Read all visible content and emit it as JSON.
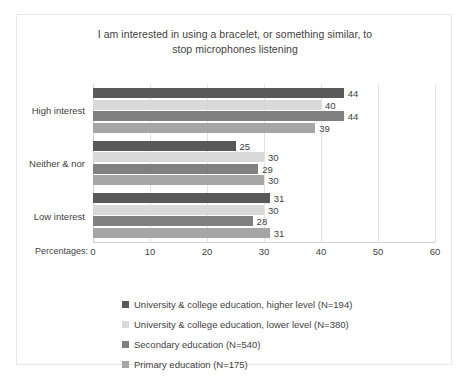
{
  "chart_data": {
    "type": "bar",
    "orientation": "horizontal",
    "title": "I am interested in using a bracelet, or something  similar, to\nstop microphones listening",
    "xlabel": "Percentages:",
    "ylabel": "",
    "categories": [
      "High interest",
      "Neither & nor",
      "Low interest"
    ],
    "series": [
      {
        "name": "University & college education, higher level  (N=194)",
        "color": "#595959",
        "values": [
          44,
          25,
          31
        ]
      },
      {
        "name": "University & college education, lower level  (N=380)",
        "color": "#d9d9d9",
        "values": [
          40,
          30,
          30
        ]
      },
      {
        "name": "Secondary education (N=540)",
        "color": "#808080",
        "values": [
          44,
          29,
          28
        ]
      },
      {
        "name": "Primary education (N=175)",
        "color": "#a6a6a6",
        "values": [
          39,
          30,
          31
        ]
      }
    ],
    "xlim": [
      0,
      60
    ],
    "xticks": [
      "0",
      "10",
      "20",
      "30",
      "40",
      "50",
      "60"
    ],
    "grid": true,
    "legend_position": "bottom"
  },
  "axis": {
    "percentages_label": "Percentages:"
  }
}
